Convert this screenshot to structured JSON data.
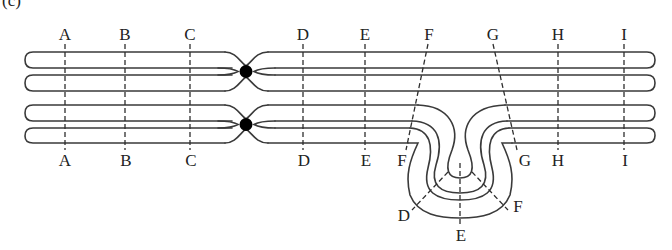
{
  "figure": {
    "panel_label": "(c)",
    "colors": {
      "strand": "#3a3a3a",
      "centromere": "#000000",
      "guide": "#2e2e2e",
      "text": "#222222"
    }
  },
  "top_labels": [
    "A",
    "B",
    "C",
    "D",
    "E",
    "F",
    "G",
    "H",
    "I"
  ],
  "bottom_labels": [
    "A",
    "B",
    "C",
    "D",
    "E",
    "F",
    "G",
    "H",
    "I"
  ],
  "loop_labels": [
    "D",
    "E",
    "F"
  ],
  "chromosomes": [
    {
      "name": "normal homolog",
      "order": "A B C • D E F G H I"
    },
    {
      "name": "inverted homolog",
      "order": "A B C • D E F G H I with D–F inverted in loop"
    }
  ]
}
